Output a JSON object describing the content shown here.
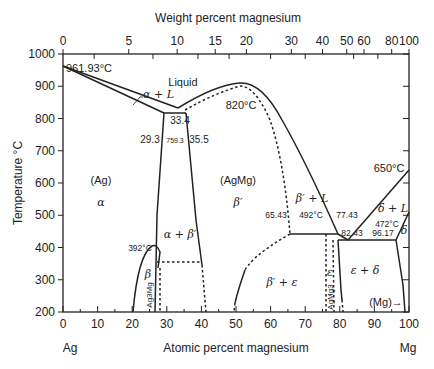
{
  "chart_data": {
    "type": "phase-diagram",
    "xlabel": "Atomic percent magnesium",
    "x2label": "Weight percent magnesium",
    "ylabel": "Temperature °C",
    "x_left_label": "Ag",
    "x_right_label": "Mg",
    "xlim": [
      0,
      100
    ],
    "ylim": [
      200,
      1000
    ],
    "x_ticks": [
      "0",
      "10",
      "20",
      "30",
      "40",
      "50",
      "60",
      "70",
      "80",
      "90",
      "100"
    ],
    "x2_ticks": [
      {
        "label": "0",
        "at": 0
      },
      {
        "label": "5",
        "at": 19
      },
      {
        "label": "10",
        "at": 33
      },
      {
        "label": "15",
        "at": 44
      },
      {
        "label": "20",
        "at": 53
      },
      {
        "label": "30",
        "at": 66
      },
      {
        "label": "40",
        "at": 75
      },
      {
        "label": "50",
        "at": 82
      },
      {
        "label": "60",
        "at": 87
      },
      {
        "label": "80",
        "at": 95
      },
      {
        "label": "100",
        "at": 100
      }
    ],
    "y_ticks": [
      "1000",
      "900",
      "800",
      "700",
      "600",
      "500",
      "400",
      "300",
      "200"
    ],
    "annotations": [
      {
        "text": "961.93°C",
        "x": 0,
        "y": 961.93
      },
      {
        "text": "Liquid",
        "x": 33,
        "y": 880
      },
      {
        "text": "α + L",
        "x": 20,
        "y": 855
      },
      {
        "text": "820°C",
        "x": 51,
        "y": 820
      },
      {
        "text": "33.4",
        "x": 33.4,
        "y": 775
      },
      {
        "text": "29.3",
        "x": 29.3,
        "y": 759.3
      },
      {
        "text": "759.3",
        "x": 31.5,
        "y": 759.3
      },
      {
        "text": "35.5",
        "x": 35.5,
        "y": 759.3
      },
      {
        "text": "650°C",
        "x": 100,
        "y": 650
      },
      {
        "text": "(Ag)",
        "x": 12,
        "y": 600
      },
      {
        "text": "α",
        "x": 12,
        "y": 540
      },
      {
        "text": "(AgMg)",
        "x": 51,
        "y": 600
      },
      {
        "text": "β′",
        "x": 51,
        "y": 540
      },
      {
        "text": "β′ + L",
        "x": 70,
        "y": 545
      },
      {
        "text": "δ + L",
        "x": 92,
        "y": 510
      },
      {
        "text": "65.43",
        "x": 65.43,
        "y": 492
      },
      {
        "text": "492°C",
        "x": 71,
        "y": 492
      },
      {
        "text": "77.43",
        "x": 77.43,
        "y": 492
      },
      {
        "text": "82.43",
        "x": 82.43,
        "y": 472
      },
      {
        "text": "472°C",
        "x": 91,
        "y": 472
      },
      {
        "text": "96.17",
        "x": 96.17,
        "y": 472
      },
      {
        "text": "δ",
        "x": 98.5,
        "y": 455
      },
      {
        "text": "α + β′",
        "x": 32,
        "y": 430
      },
      {
        "text": "392°C",
        "x": 26,
        "y": 392
      },
      {
        "text": "β",
        "x": 24.5,
        "y": 335
      },
      {
        "text": "Ag3Mg",
        "x": 25,
        "y": 250
      },
      {
        "text": "β′ + ε",
        "x": 63,
        "y": 280
      },
      {
        "text": "ε",
        "x": 77,
        "y": 300
      },
      {
        "text": "AgMg3",
        "x": 78.3,
        "y": 240
      },
      {
        "text": "ε + δ",
        "x": 88,
        "y": 300
      },
      {
        "text": "(Mg)→",
        "x": 93,
        "y": 222
      }
    ],
    "invariants": [
      {
        "name": "Ag melting point",
        "T": 961.93,
        "x": 0
      },
      {
        "name": "eutectic α/β′",
        "T": 759.3,
        "compositions": [
          29.3,
          33.4,
          35.5
        ]
      },
      {
        "name": "AgMg congruent melting",
        "T": 820,
        "x": 51
      },
      {
        "name": "peritectic ε",
        "T": 492,
        "compositions": [
          65.43,
          77.43
        ]
      },
      {
        "name": "eutectic ε/δ",
        "T": 472,
        "compositions": [
          77.43,
          82.43,
          96.17
        ]
      },
      {
        "name": "Mg melting point",
        "T": 650,
        "x": 100
      },
      {
        "name": "β ordering max",
        "T": 392,
        "x": 26
      }
    ],
    "grid": false,
    "legend": "none"
  }
}
